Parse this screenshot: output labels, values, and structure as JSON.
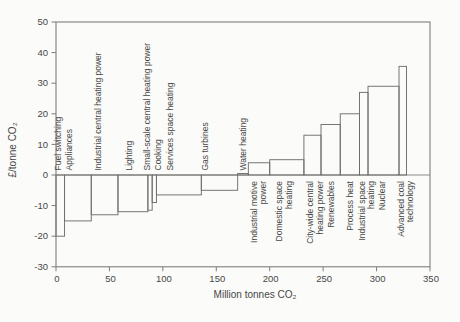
{
  "figure": {
    "background": "#fbfbf9",
    "line_color": "#7e7e7e",
    "bar_line_color": "#6f6f6f",
    "text_color": "#474747"
  },
  "chart_data": {
    "type": "bar",
    "subtype": "marginal-abatement-cost-step-curve",
    "title": "",
    "xlabel": "Million tonnes CO₂",
    "ylabel": "£/tonne CO₂",
    "xlim": [
      0,
      350
    ],
    "ylim": [
      -30,
      50
    ],
    "x_ticks": [
      0,
      50,
      100,
      150,
      200,
      250,
      300,
      350
    ],
    "y_ticks": [
      50,
      40,
      30,
      20,
      10,
      0,
      -10,
      -20,
      -30
    ],
    "grid": false,
    "legend": false,
    "zero_line": true,
    "measures": [
      {
        "label": "Fuel switching",
        "lines": [
          "Fuel switching"
        ],
        "from": 0,
        "to": 8,
        "cost": -20,
        "side": "above",
        "label_at": 2
      },
      {
        "label": "Appliances",
        "lines": [
          "Appliances"
        ],
        "from": 8,
        "to": 33,
        "cost": -15,
        "side": "above",
        "label_at": 12.5
      },
      {
        "label": "Industrial central heating power",
        "lines": [
          "Industrial central heating power"
        ],
        "from": 33,
        "to": 58,
        "cost": -13,
        "side": "above",
        "label_at": 39
      },
      {
        "label": "Lighting",
        "lines": [
          "Lighting"
        ],
        "from": 58,
        "to": 86,
        "cost": -12,
        "side": "above",
        "label_at": 68.5
      },
      {
        "label": "Small-scale central heating power",
        "lines": [
          "Small-scale central heating power"
        ],
        "from": 86,
        "to": 90,
        "cost": -11.5,
        "side": "above",
        "label_at": 85
      },
      {
        "label": "Cooking",
        "lines": [
          "Cooking"
        ],
        "from": 90,
        "to": 94,
        "cost": -9,
        "side": "above",
        "label_at": 95.5
      },
      {
        "label": "Services space heating",
        "lines": [
          "Services space heating"
        ],
        "from": 94,
        "to": 136,
        "cost": -6.5,
        "side": "above",
        "label_at": 106.5
      },
      {
        "label": "Gas turbines",
        "lines": [
          "Gas turbines"
        ],
        "from": 136,
        "to": 170,
        "cost": -5,
        "side": "above",
        "label_at": 139
      },
      {
        "label": "Water heating",
        "lines": [
          "Water heating"
        ],
        "from": 170,
        "to": 180,
        "cost": 0.5,
        "side": "above",
        "label_at": 175
      },
      {
        "label": "Industrial motive power",
        "lines": [
          "Industrial motive",
          "power"
        ],
        "from": 180,
        "to": 200,
        "cost": 4,
        "side": "below",
        "label_at": 185
      },
      {
        "label": "Domestic space heating",
        "lines": [
          "Domestic space",
          "heating"
        ],
        "from": 200,
        "to": 232,
        "cost": 5,
        "side": "below",
        "label_at": 209
      },
      {
        "label": "City-wide central heating power",
        "lines": [
          "City-wide central",
          "heating power"
        ],
        "from": 232,
        "to": 248,
        "cost": 13,
        "side": "below",
        "label_at": 238
      },
      {
        "label": "Renewables",
        "lines": [
          "Renewables"
        ],
        "from": 248,
        "to": 266,
        "cost": 16.5,
        "side": "below",
        "label_at": 257
      },
      {
        "label": "Process heat",
        "lines": [
          "Process heat"
        ],
        "from": 266,
        "to": 284,
        "cost": 20,
        "side": "below",
        "label_at": 275
      },
      {
        "label": "Industrial space heating",
        "lines": [
          "Industrial space",
          "heating"
        ],
        "from": 284,
        "to": 292,
        "cost": 27,
        "side": "below",
        "label_at": 286
      },
      {
        "label": "Nuclear",
        "lines": [
          "Nuclear"
        ],
        "from": 292,
        "to": 321,
        "cost": 29,
        "side": "below",
        "label_at": 305
      },
      {
        "label": "Advanced coal technology",
        "lines": [
          "Advanced coal",
          "technology"
        ],
        "from": 321,
        "to": 328,
        "cost": 35.5,
        "side": "below",
        "label_at": 323
      }
    ]
  }
}
